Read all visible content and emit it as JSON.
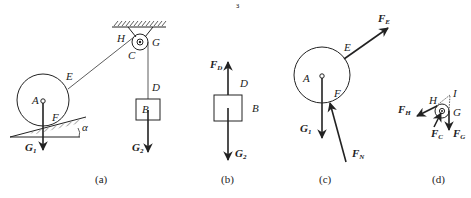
{
  "diagram": {
    "panels": [
      {
        "id": "a",
        "caption": "(a)",
        "labels": {
          "H": "H",
          "G": "G",
          "C": "C",
          "E": "E",
          "D": "D",
          "A": "A",
          "B": "B",
          "F": "F",
          "alpha": "α",
          "G1_main": "G",
          "G1_sub": "1",
          "G2_main": "G",
          "G2_sub": "2"
        }
      },
      {
        "id": "b",
        "caption": "(b)",
        "labels": {
          "FD_main": "F",
          "FD_sub": "D",
          "D": "D",
          "B": "B",
          "G2_main": "G",
          "G2_sub": "2"
        }
      },
      {
        "id": "c",
        "caption": "(c)",
        "labels": {
          "FE_main": "F",
          "FE_sub": "E",
          "E": "E",
          "A": "A",
          "F": "F",
          "G1_main": "G",
          "G1_sub": "1",
          "FN_main": "F",
          "FN_sub": "N"
        }
      },
      {
        "id": "d",
        "caption": "(d)",
        "labels": {
          "H": "H",
          "I": "I",
          "G": "G",
          "FH_main": "F",
          "FH_sub": "H",
          "FC_main": "F",
          "FC_sub": "C",
          "FG_main": "F",
          "FG_sub": "G"
        }
      }
    ],
    "stray_mark": "ɜ"
  }
}
